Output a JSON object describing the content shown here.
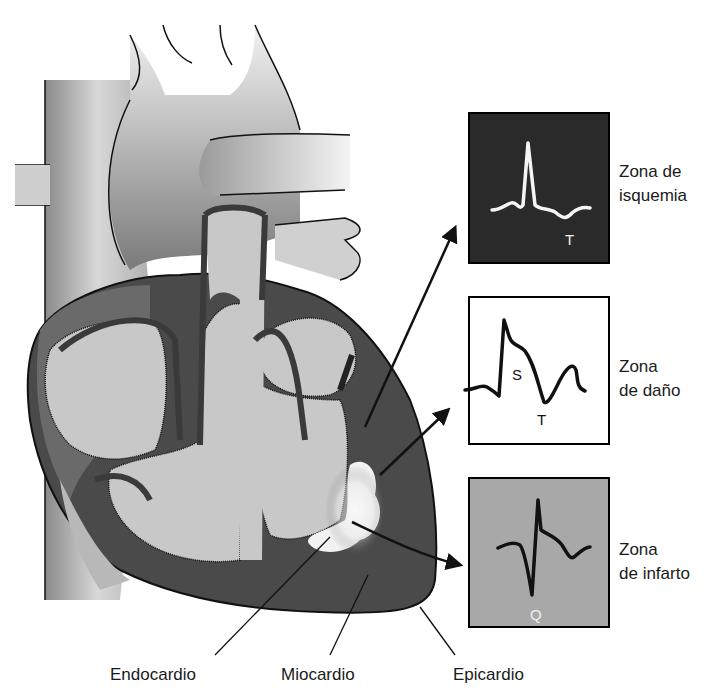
{
  "figure": {
    "colors": {
      "myocardium": "#4a4a4a",
      "chamber": "#c8c8c8",
      "vessel_light": "#d8d8d8",
      "ischemia_box": "#2a2a2a",
      "damage_box": "#ffffff",
      "infarct_box": "#a8a8a8",
      "infarct_area": "#f0f0f0"
    }
  },
  "layers": {
    "endocardio": "Endocardio",
    "miocardio": "Miocardio",
    "epicardio": "Epicardio"
  },
  "zones": [
    {
      "id": "isquemia",
      "line1": "Zona de",
      "line2": "isquemia",
      "ecg_marker": "T"
    },
    {
      "id": "dano",
      "line1": "Zona",
      "line2": "de daño",
      "ecg_marker_1": "S",
      "ecg_marker_2": "T"
    },
    {
      "id": "infarto",
      "line1": "Zona",
      "line2": "de infarto",
      "ecg_marker": "Q"
    }
  ]
}
